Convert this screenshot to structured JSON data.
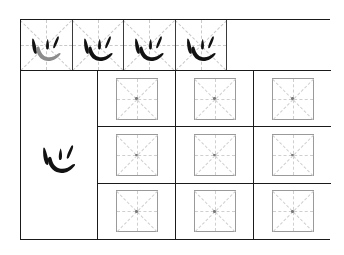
{
  "worksheet": {
    "character": "心",
    "character_pinyin_unused": null,
    "stroke_order_row": {
      "label": "stroke-order-demonstration-row",
      "cells": [
        {
          "index": 1,
          "glyph": "心",
          "strokes_shown": [
            "dian-left",
            "wo-gou",
            "dian-middle",
            "dian-right"
          ],
          "highlight_stroke": "wo-gou",
          "highlight_color": "#8c8c8c",
          "ink_color": "#121212"
        },
        {
          "index": 2,
          "glyph": "心",
          "strokes_shown": [
            "dian-left",
            "wo-gou",
            "dian-middle",
            "dian-right"
          ],
          "highlight_stroke": null,
          "highlight_color": null,
          "ink_color": "#121212"
        },
        {
          "index": 3,
          "glyph": "心",
          "strokes_shown": [
            "dian-left",
            "wo-gou",
            "dian-middle",
            "dian-right"
          ],
          "highlight_stroke": null,
          "highlight_color": null,
          "ink_color": "#121212"
        },
        {
          "index": 4,
          "glyph": "心",
          "strokes_shown": [
            "dian-left",
            "wo-gou",
            "dian-middle",
            "dian-right"
          ],
          "highlight_stroke": null,
          "highlight_color": null,
          "ink_color": "#121212"
        }
      ],
      "empty_tail": true
    },
    "model_panel": {
      "label": "model-character-panel",
      "glyph": "心",
      "ink_color": "#121212"
    },
    "practice_grid": {
      "label": "blank-practice-grid",
      "rows": 3,
      "columns": 3,
      "cell_type": "mizige",
      "cells": [
        {
          "row": 1,
          "col": 1,
          "content": ""
        },
        {
          "row": 1,
          "col": 2,
          "content": ""
        },
        {
          "row": 1,
          "col": 3,
          "content": ""
        },
        {
          "row": 2,
          "col": 1,
          "content": ""
        },
        {
          "row": 2,
          "col": 2,
          "content": ""
        },
        {
          "row": 2,
          "col": 3,
          "content": ""
        },
        {
          "row": 3,
          "col": 1,
          "content": ""
        },
        {
          "row": 3,
          "col": 2,
          "content": ""
        },
        {
          "row": 3,
          "col": 3,
          "content": ""
        }
      ]
    },
    "colors": {
      "frame_border": "#1a1a1a",
      "cell_border": "#3a3a3a",
      "mizi_border": "#9a9a9a",
      "guide_line": "#c9c9c9",
      "ink": "#121212",
      "ghost_ink": "#8c8c8c",
      "paper": "#ffffff"
    }
  }
}
